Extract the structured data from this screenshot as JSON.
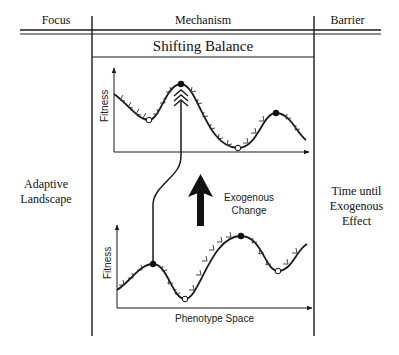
{
  "header": {
    "columns": [
      {
        "label": "Focus"
      },
      {
        "label": "Mechanism"
      },
      {
        "label": "Barrier"
      }
    ]
  },
  "mechanism": {
    "title": "Shifting Balance"
  },
  "focus": {
    "label_line1": "Adaptive",
    "label_line2": "Landscape"
  },
  "barrier": {
    "label_line1": "Time until",
    "label_line2": "Exogenous",
    "label_line3": "Effect"
  },
  "diagram": {
    "upper_plot": {
      "y_axis_label": "Fitness",
      "peaks_filled": [
        [
          181,
          84
        ],
        [
          276,
          113
        ]
      ],
      "valleys_open": [
        [
          149,
          120
        ],
        [
          238,
          148
        ]
      ]
    },
    "lower_plot": {
      "y_axis_label": "Fitness",
      "x_axis_label": "Phenotype Space",
      "peaks_filled": [
        [
          153,
          264
        ],
        [
          241,
          236
        ]
      ],
      "valleys_open": [
        [
          185,
          299
        ],
        [
          278,
          271
        ]
      ]
    },
    "arrow_label_line1": "Exogenous",
    "arrow_label_line2": "Change",
    "line_color": "#1a1a1a"
  }
}
